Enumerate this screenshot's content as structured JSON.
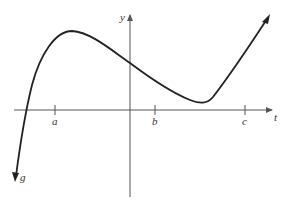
{
  "diagram": {
    "type": "function-graph",
    "axes": {
      "horizontal_label": "t",
      "vertical_label": "y"
    },
    "ticks": [
      {
        "label": "a",
        "x": 55
      },
      {
        "label": "b",
        "x": 155
      },
      {
        "label": "c",
        "x": 245
      }
    ],
    "curve": {
      "label": "g",
      "description": "Cubic-like curve: rises steeply from bottom-left, crosses t-axis left of a, local max between a and y-axis, crosses y-axis above origin, decreases to local min just touching near t-axis between b and c, then rises steeply with arrow to upper right"
    },
    "colors": {
      "background": "#ffffff",
      "axis": "#555555",
      "curve": "#222222",
      "text": "#333333"
    }
  }
}
